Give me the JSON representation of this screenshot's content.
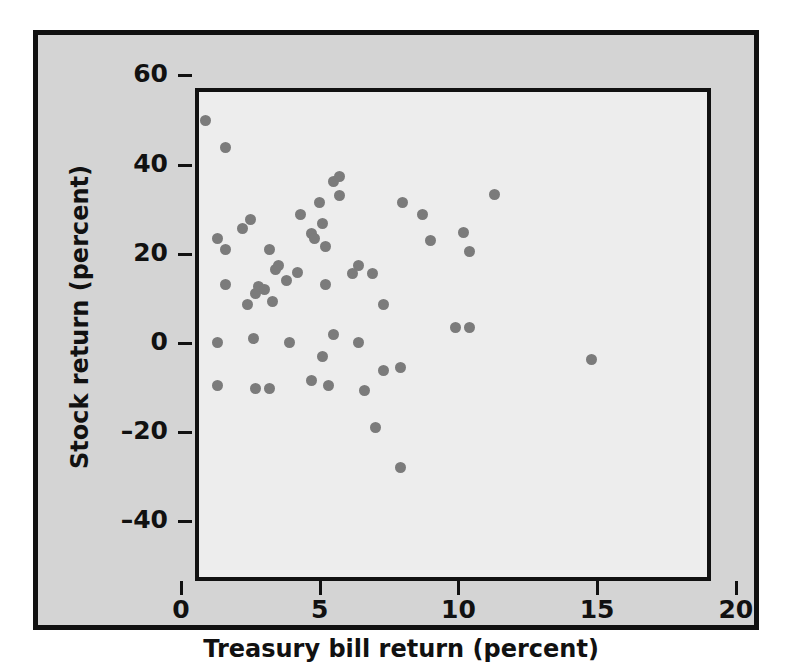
{
  "chart_data": {
    "type": "scatter",
    "title": "",
    "xlabel": "Treasury bill return (percent)",
    "ylabel": "Stock return (percent)",
    "xlim": [
      0,
      21
    ],
    "ylim": [
      -44,
      64
    ],
    "xticks": [
      0,
      5,
      10,
      15,
      20
    ],
    "xtick_labels": [
      "0",
      "5",
      "10",
      "15",
      "20"
    ],
    "yticks": [
      -40,
      -20,
      0,
      20,
      40,
      60
    ],
    "ytick_labels": [
      "–40",
      "–20",
      "0",
      "20",
      "40",
      "60"
    ],
    "grid": false,
    "legend": false,
    "marker": {
      "shape": "circle",
      "color": "#7b7b7b",
      "size_px": 11
    },
    "point_count": 56,
    "points": [
      {
        "x": 0.9,
        "y": 50.0
      },
      {
        "x": 1.6,
        "y": 43.9
      },
      {
        "x": 1.3,
        "y": 23.5
      },
      {
        "x": 1.6,
        "y": 20.9
      },
      {
        "x": 1.6,
        "y": 13.2
      },
      {
        "x": 1.3,
        "y": 0.2
      },
      {
        "x": 1.3,
        "y": -9.6
      },
      {
        "x": 2.2,
        "y": 25.6
      },
      {
        "x": 2.5,
        "y": 27.6
      },
      {
        "x": 2.4,
        "y": 8.7
      },
      {
        "x": 2.7,
        "y": 11.2
      },
      {
        "x": 2.8,
        "y": 12.6
      },
      {
        "x": 2.6,
        "y": 0.9
      },
      {
        "x": 2.7,
        "y": -10.1
      },
      {
        "x": 3.2,
        "y": -10.1
      },
      {
        "x": 3.2,
        "y": 20.9
      },
      {
        "x": 3.4,
        "y": 16.4
      },
      {
        "x": 3.3,
        "y": 9.4
      },
      {
        "x": 3.5,
        "y": 17.3
      },
      {
        "x": 3.8,
        "y": 14.1
      },
      {
        "x": 3.9,
        "y": 0.2
      },
      {
        "x": 4.3,
        "y": 28.7
      },
      {
        "x": 4.2,
        "y": 15.9
      },
      {
        "x": 4.7,
        "y": 24.5
      },
      {
        "x": 4.8,
        "y": 23.5
      },
      {
        "x": 4.7,
        "y": -8.5
      },
      {
        "x": 5.0,
        "y": 31.6
      },
      {
        "x": 5.1,
        "y": 26.9
      },
      {
        "x": 5.2,
        "y": 21.7
      },
      {
        "x": 5.2,
        "y": 13.2
      },
      {
        "x": 5.1,
        "y": -3.1
      },
      {
        "x": 5.3,
        "y": -9.6
      },
      {
        "x": 5.5,
        "y": 36.1
      },
      {
        "x": 5.7,
        "y": 37.4
      },
      {
        "x": 5.7,
        "y": 33.0
      },
      {
        "x": 5.5,
        "y": 1.8
      },
      {
        "x": 6.2,
        "y": 15.5
      },
      {
        "x": 6.4,
        "y": 17.3
      },
      {
        "x": 6.4,
        "y": 0.2
      },
      {
        "x": 6.6,
        "y": -10.6
      },
      {
        "x": 7.0,
        "y": -19.0
      },
      {
        "x": 7.3,
        "y": 8.7
      },
      {
        "x": 7.3,
        "y": -6.1
      },
      {
        "x": 7.9,
        "y": -5.6
      },
      {
        "x": 7.9,
        "y": -28.0
      },
      {
        "x": 8.0,
        "y": 31.4
      },
      {
        "x": 8.7,
        "y": 28.7
      },
      {
        "x": 9.0,
        "y": 22.9
      },
      {
        "x": 9.9,
        "y": 3.4
      },
      {
        "x": 10.2,
        "y": 24.7
      },
      {
        "x": 10.4,
        "y": 20.6
      },
      {
        "x": 10.4,
        "y": 3.4
      },
      {
        "x": 11.3,
        "y": 33.2
      },
      {
        "x": 14.8,
        "y": -3.8
      },
      {
        "x": 6.9,
        "y": 15.5
      },
      {
        "x": 3.0,
        "y": 12.1
      }
    ]
  },
  "figure": {
    "background_color": "#d4d4d4",
    "panel_color": "#ededed",
    "frame_color": "#111111",
    "page_color": "#ffffff"
  }
}
